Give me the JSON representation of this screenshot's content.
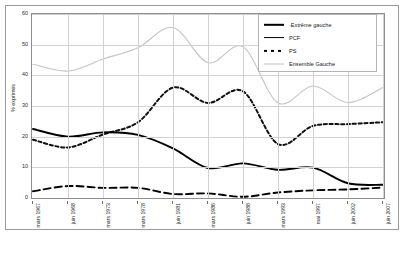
{
  "chart": {
    "yaxis_title": "% exprimés",
    "ylim": [
      0,
      60
    ],
    "yticks": [
      0,
      10,
      20,
      30,
      40,
      50,
      60
    ]
  },
  "legend": {
    "items": [
      {
        "label": "·Extrême gauche",
        "style": "solid-thick",
        "name": "legend-extreme-gauche"
      },
      {
        "label": "PCF",
        "style": "solid-med",
        "name": "legend-pcf"
      },
      {
        "label": "PS",
        "style": "dotted",
        "name": "legend-ps"
      },
      {
        "label": "Ensemble Gauche",
        "style": "light",
        "name": "legend-ensemble-gauche"
      }
    ]
  },
  "chart_data": {
    "type": "line",
    "title": "",
    "xlabel": "",
    "ylabel": "% exprimés",
    "ylim": [
      0,
      60
    ],
    "grid": true,
    "legend_position": "top-right",
    "categories": [
      "mars 1967",
      "juin 1968",
      "mars 1973",
      "mars 1978",
      "juin 1981",
      "mars 1986",
      "juin 1988",
      "mars 1993",
      "mai 1997",
      "juin 2002",
      "juin 2007"
    ],
    "series": [
      {
        "name": "Extrême gauche",
        "values": [
          2.2,
          3.9,
          3.3,
          3.3,
          1.3,
          1.5,
          0.4,
          1.8,
          2.5,
          2.8,
          3.4
        ]
      },
      {
        "name": "PCF",
        "values": [
          22.5,
          20.0,
          21.4,
          20.6,
          16.2,
          9.8,
          11.3,
          9.2,
          9.9,
          4.8,
          4.3
        ]
      },
      {
        "name": "PS",
        "values": [
          19.0,
          16.5,
          20.7,
          24.7,
          36.0,
          31.0,
          34.8,
          17.6,
          23.5,
          24.1,
          24.7
        ]
      },
      {
        "name": "Ensemble Gauche",
        "values": [
          43.6,
          41.4,
          45.3,
          49.0,
          55.6,
          44.1,
          49.3,
          31.0,
          36.5,
          31.1,
          36.0
        ]
      }
    ]
  }
}
